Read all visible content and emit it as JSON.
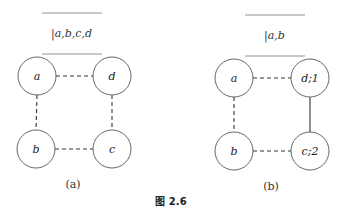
{
  "figure": {
    "caption": "图 2.6",
    "panels": [
      {
        "id": "a",
        "sublabel": "(a)",
        "stack_text": "|a,b,c,d",
        "nodes": [
          {
            "id": "a",
            "label": "a",
            "x": 37,
            "y": 76
          },
          {
            "id": "d",
            "label": "d",
            "x": 112,
            "y": 76
          },
          {
            "id": "b",
            "label": "b",
            "x": 36,
            "y": 149
          },
          {
            "id": "c",
            "label": "c",
            "x": 112,
            "y": 149
          }
        ],
        "edges": [
          {
            "from": "a",
            "to": "d",
            "style": "dashed"
          },
          {
            "from": "a",
            "to": "b",
            "style": "dashed"
          },
          {
            "from": "d",
            "to": "c",
            "style": "dashed"
          },
          {
            "from": "b",
            "to": "c",
            "style": "dashed"
          }
        ]
      },
      {
        "id": "b",
        "sublabel": "(b)",
        "stack_text": "|a,b",
        "nodes": [
          {
            "id": "a",
            "label": "a",
            "x": 234,
            "y": 78
          },
          {
            "id": "d",
            "label": "d;1",
            "x": 310,
            "y": 78
          },
          {
            "id": "b",
            "label": "b",
            "x": 234,
            "y": 151
          },
          {
            "id": "c",
            "label": "c;2",
            "x": 310,
            "y": 151
          }
        ],
        "edges": [
          {
            "from": "a",
            "to": "d",
            "style": "dashed"
          },
          {
            "from": "a",
            "to": "b",
            "style": "dashed"
          },
          {
            "from": "d",
            "to": "c",
            "style": "solid"
          },
          {
            "from": "b",
            "to": "c",
            "style": "dashed"
          }
        ]
      }
    ]
  }
}
